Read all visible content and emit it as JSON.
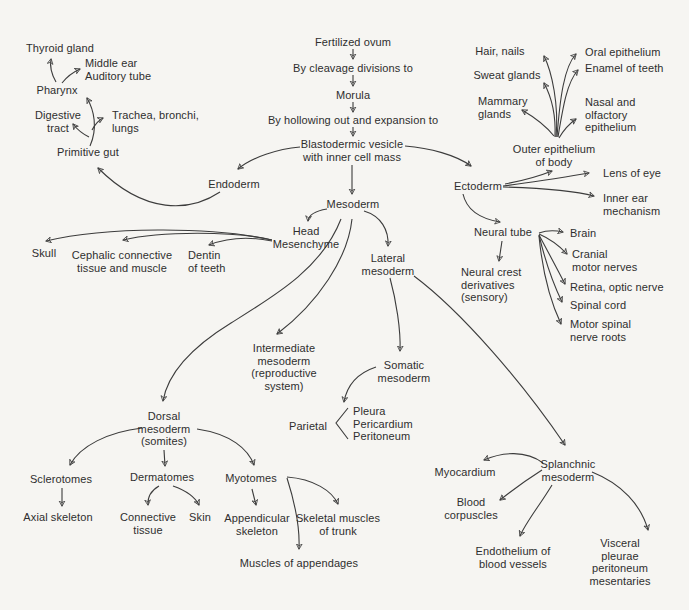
{
  "colors": {
    "background": "#f6f5f2",
    "ink": "#2e2e2e",
    "line": "#3c3c3c"
  },
  "diagram_title": "Derivatives of the germ layers (fertilized ovum development)",
  "nodes": {
    "fertilized_ovum": "Fertilized ovum",
    "by_cleavage": "By cleavage divisions to",
    "morula": "Morula",
    "by_hollowing": "By hollowing out and expansion to",
    "blastodermic_vesicle": "Blastodermic vesicle\nwith inner cell mass",
    "endoderm": "Endoderm",
    "ectoderm": "Ectoderm",
    "mesoderm": "Mesoderm",
    "head_mesenchyme": "Head\nMesenchyme",
    "lateral_mesoderm": "Lateral\nmesoderm",
    "thyroid_gland": "Thyroid gland",
    "middle_ear": "Middle ear\nAuditory tube",
    "pharynx": "Pharynx",
    "digestive_tract": "Digestive\ntract",
    "trachea_bronchi_lungs": "Trachea, bronchi,\nlungs",
    "primitive_gut": "Primitive gut",
    "skull": "Skull",
    "cephalic_connective": "Cephalic connective\ntissue and muscle",
    "dentin_of_teeth": "Dentin\nof teeth",
    "hair_nails": "Hair, nails",
    "sweat_glands": "Sweat glands",
    "mammary_glands": "Mammary\nglands",
    "oral_epithelium": "Oral epithelium",
    "enamel_of_teeth": "Enamel of teeth",
    "nasal_olfactory": "Nasal and\nolfactory\nepithelium",
    "outer_epithelium": "Outer epithelium\nof body",
    "lens_of_eye": "Lens of eye",
    "inner_ear_mechanism": "Inner ear\nmechanism",
    "neural_tube": "Neural tube",
    "neural_crest": "Neural crest\nderivatives\n(sensory)",
    "brain": "Brain",
    "cranial_motor_nerves": "Cranial\nmotor nerves",
    "retina_optic_nerve": "Retina, optic nerve",
    "spinal_cord": "Spinal cord",
    "motor_spinal_nerve_roots": "Motor spinal\nnerve roots",
    "intermediate_mesoderm": "Intermediate\nmesoderm\n(reproductive\nsystem)",
    "somatic_mesoderm": "Somatic\nmesoderm",
    "parietal": "Parietal",
    "pleura_list": "Pleura\nPericardium\nPeritoneum",
    "dorsal_mesoderm": "Dorsal\nmesoderm\n(somites)",
    "sclerotomes": "Sclerotomes",
    "dermatomes": "Dermatomes",
    "myotomes": "Myotomes",
    "axial_skeleton": "Axial skeleton",
    "connective_tissue": "Connective\ntissue",
    "skin": "Skin",
    "appendicular_skeleton": "Appendicular\nskeleton",
    "skeletal_muscles_of_trunk": "Skeletal muscles\nof trunk",
    "muscles_of_appendages": "Muscles of appendages",
    "splanchnic_mesoderm": "Splanchnic\nmesoderm",
    "myocardium": "Myocardium",
    "blood_corpuscles": "Blood\ncorpuscles",
    "endothelium_blood_vessels": "Endothelium of\nblood vessels",
    "visceral_pleurae": "Visceral pleurae\nperitoneum\nmesentaries"
  }
}
